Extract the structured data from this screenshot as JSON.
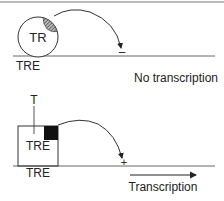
{
  "diagram": {
    "top_panel": {
      "receptor_label": "TR",
      "element_label": "TRE",
      "marker": "–",
      "outcome": "No transcription"
    },
    "bottom_panel": {
      "hormone_label": "T",
      "element_inside_label": "TRE",
      "element_label": "TRE",
      "marker": "+",
      "outcome": "Transcription"
    },
    "colors": {
      "line": "#555555",
      "text": "#222222",
      "fill_dark": "#111111"
    }
  }
}
